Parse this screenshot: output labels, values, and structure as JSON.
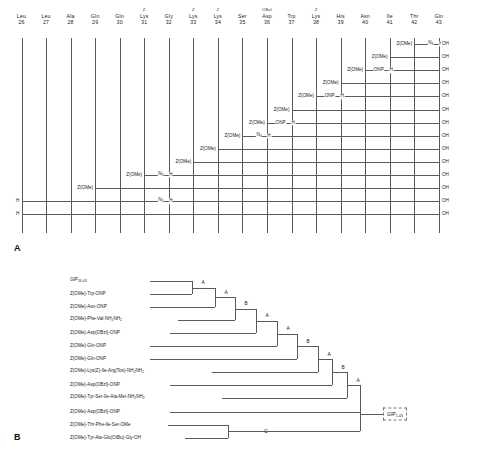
{
  "figure": {
    "panel_a": {
      "letter": "A",
      "residues": [
        {
          "sup": "",
          "name": "Leu",
          "number": "26"
        },
        {
          "sup": "",
          "name": "Leu",
          "number": "27"
        },
        {
          "sup": "",
          "name": "Ala",
          "number": "28"
        },
        {
          "sup": "",
          "name": "Gln",
          "number": "29"
        },
        {
          "sup": "",
          "name": "Gln",
          "number": "30"
        },
        {
          "sup": "Z",
          "name": "Lys",
          "number": "31"
        },
        {
          "sup": "",
          "name": "Gly",
          "number": "32"
        },
        {
          "sup": "Z",
          "name": "Lys",
          "number": "33"
        },
        {
          "sup": "Z",
          "name": "Lys",
          "number": "34"
        },
        {
          "sup": "",
          "name": "Ser",
          "number": "35"
        },
        {
          "sup": "OBzl",
          "name": "Asp",
          "number": "36"
        },
        {
          "sup": "",
          "name": "Trp",
          "number": "37"
        },
        {
          "sup": "Z",
          "name": "Lys",
          "number": "38"
        },
        {
          "sup": "",
          "name": "His",
          "number": "39"
        },
        {
          "sup": "",
          "name": "Asn",
          "number": "40"
        },
        {
          "sup": "",
          "name": "Ile",
          "number": "41"
        },
        {
          "sup": "",
          "name": "Thr",
          "number": "42"
        },
        {
          "sup": "",
          "name": "Gln",
          "number": "43"
        }
      ],
      "terminal_label": "OH",
      "rows": [
        {
          "start_col": 16,
          "left_label": "Z(OMe)",
          "mid_label": "",
          "mid_col": 0,
          "h_label": "H",
          "azide": true,
          "azide_col": 17
        },
        {
          "start_col": 15,
          "left_label": "Z(OMe)",
          "mid_label": "",
          "mid_col": 0,
          "h_label": "",
          "azide": false,
          "azide_col": 0
        },
        {
          "start_col": 14,
          "left_label": "Z(OMe)",
          "mid_label": "ONP",
          "mid_col": 15,
          "h_label": "H",
          "azide": false,
          "azide_col": 0
        },
        {
          "start_col": 13,
          "left_label": "Z(OMe)",
          "mid_label": "",
          "mid_col": 0,
          "h_label": "",
          "azide": false,
          "azide_col": 0
        },
        {
          "start_col": 12,
          "left_label": "Z(OMe)",
          "mid_label": "ONP",
          "mid_col": 13,
          "h_label": "H",
          "azide": false,
          "azide_col": 0
        },
        {
          "start_col": 11,
          "left_label": "Z(OMe)",
          "mid_label": "",
          "mid_col": 0,
          "h_label": "",
          "azide": false,
          "azide_col": 0
        },
        {
          "start_col": 10,
          "left_label": "Z(OMe)",
          "mid_label": "ONP",
          "mid_col": 11,
          "h_label": "H",
          "azide": false,
          "azide_col": 0
        },
        {
          "start_col": 9,
          "left_label": "Z(OMe)",
          "mid_label": "",
          "mid_col": 0,
          "h_label": "H",
          "azide": true,
          "azide_col": 10
        },
        {
          "start_col": 8,
          "left_label": "Z(OMe)",
          "mid_label": "",
          "mid_col": 0,
          "h_label": "",
          "azide": false,
          "azide_col": 0
        },
        {
          "start_col": 7,
          "left_label": "Z(OMe)",
          "mid_label": "",
          "mid_col": 0,
          "h_label": "",
          "azide": false,
          "azide_col": 0
        },
        {
          "start_col": 5,
          "left_label": "Z(OMe)",
          "mid_label": "",
          "mid_col": 0,
          "h_label": "H",
          "azide": true,
          "azide_col": 6
        },
        {
          "start_col": 3,
          "left_label": "Z(OMe)",
          "mid_label": "",
          "mid_col": 0,
          "h_label": "",
          "azide": false,
          "azide_col": 0
        },
        {
          "start_col": 0,
          "left_label": "H",
          "mid_label": "",
          "mid_col": 0,
          "h_label": "H",
          "azide": true,
          "azide_col": 6
        },
        {
          "start_col": 0,
          "left_label": "H",
          "mid_label": "",
          "mid_col": 0,
          "h_label": "",
          "azide": false,
          "azide_col": 0
        }
      ],
      "tokens": {
        "z_ome": "Z(OMe)",
        "onp": "ONP",
        "h": "H",
        "n3": "N",
        "n3_sub": "3",
        "oh": "OH"
      }
    },
    "panel_b": {
      "letter": "B",
      "fragments": [
        {
          "text": "GIP",
          "sub": "26-43",
          "tail": ""
        },
        {
          "text": "Z(OMe)-Trp-ONP",
          "sub": "",
          "tail": ""
        },
        {
          "text": "Z(OMe)-Asn-ONP",
          "sub": "",
          "tail": ""
        },
        {
          "text": "Z(OMe)-Phe-Val-NH",
          "sub": "2",
          "tail": "NH",
          "tail_sub": "2"
        },
        {
          "text": "Z(OMe)-Asp(OBzl)-ONP",
          "sub": "",
          "tail": ""
        },
        {
          "text": "Z(OMe)-Gln-ONP",
          "sub": "",
          "tail": ""
        },
        {
          "text": "Z(OMe)-Gln-ONP",
          "sub": "",
          "tail": ""
        },
        {
          "text": "Z(OMe)-Lys(Z)-Ile-Arg(Tos)-NH",
          "sub": "2",
          "tail": "NH",
          "tail_sub": "2"
        },
        {
          "text": "Z(OMe)-Asp(OBzl)-ONP",
          "sub": "",
          "tail": ""
        },
        {
          "text": "Z(OMe)-Tyr-Ser-Ile-Ala-Met-NH",
          "sub": "2",
          "tail": "NH",
          "tail_sub": "2"
        },
        {
          "text": "Z(OMe)-Asp(OBzl)-ONP",
          "sub": "",
          "tail": ""
        },
        {
          "text": "Z(OMe)-Thr-Phe-Ile-Ser-OMe",
          "sub": "",
          "tail": ""
        },
        {
          "text": "Z(OMe)-Tyr-Ala-Glu(OtBu)-Gly-OH",
          "sub": "",
          "tail": ""
        }
      ],
      "couplings": [
        "A",
        "A",
        "B",
        "A",
        "A",
        "B",
        "A",
        "B",
        "A",
        "C"
      ],
      "product": {
        "text": "GIP",
        "sub": "1-43"
      }
    }
  }
}
